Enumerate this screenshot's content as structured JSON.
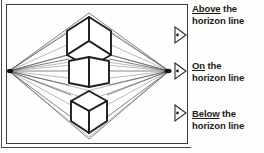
{
  "figure": {
    "type": "two-point-perspective-diagram",
    "background_color": "#fdfdfb",
    "line_color": "#2b2b2b",
    "faint_line_color": "#8a8a8a"
  },
  "diagram": {
    "horizon_line_label": "horizon line",
    "vanishing_points": [
      {
        "name": "left-vanishing-point",
        "x": 8,
        "y": 70
      },
      {
        "name": "right-vanishing-point",
        "x": 168,
        "y": 70
      }
    ],
    "cubes": [
      {
        "name": "cube-above-horizon",
        "position": "above",
        "visible_face": "bottom"
      },
      {
        "name": "cube-on-horizon",
        "position": "on",
        "visible_face": "none"
      },
      {
        "name": "cube-below-horizon",
        "position": "below",
        "visible_face": "top"
      }
    ]
  },
  "markers": [
    {
      "name": "marker-above",
      "icon": "triangle-right-icon"
    },
    {
      "name": "marker-on",
      "icon": "triangle-right-icon"
    },
    {
      "name": "marker-below",
      "icon": "triangle-right-icon"
    }
  ],
  "captions": {
    "above": {
      "keyword": "Above",
      "rest": " the",
      "line2": "horizon line"
    },
    "on": {
      "keyword": "On",
      "rest": " the",
      "line2": "horizon line"
    },
    "below": {
      "keyword": "Below",
      "rest": " the",
      "line2": "horizon line"
    }
  }
}
